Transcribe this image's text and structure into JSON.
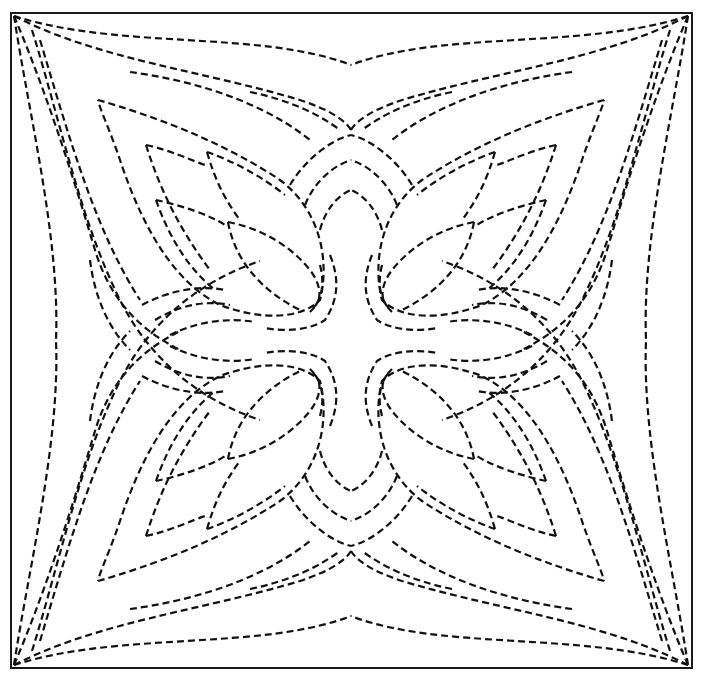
{
  "image": {
    "description": "Quilting stencil pattern: four-fold symmetric dashed-line design of stylized tulip/leaf motifs inside a square frame",
    "colors": {
      "line": "#111111",
      "background": "#ffffff"
    },
    "frame": {
      "x": 11,
      "y": 13,
      "width": 681,
      "height": 655
    },
    "motif": "tulip-quadrant",
    "symmetry": "4-fold mirror"
  }
}
